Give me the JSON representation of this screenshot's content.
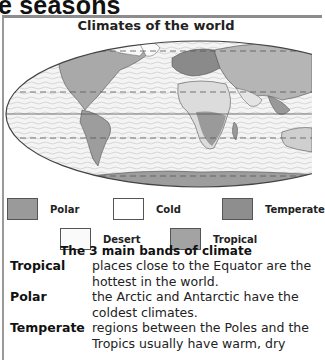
{
  "page": {
    "heading_fragment": "e seasons"
  },
  "map": {
    "title": "Climates of the world",
    "lines": [
      {
        "name": "arctic-circle",
        "style": "dashed"
      },
      {
        "name": "tropic-of-cancer",
        "style": "dashed"
      },
      {
        "name": "equator",
        "style": "solid"
      },
      {
        "name": "tropic-of-capricorn",
        "style": "dashed"
      },
      {
        "name": "antarctic-circle",
        "style": "dashed"
      }
    ]
  },
  "legend": {
    "items": [
      {
        "label": "Polar",
        "color": "#9a9a9a"
      },
      {
        "label": "Cold",
        "color": "#ffffff"
      },
      {
        "label": "Temperate",
        "color": "#8e8e8e"
      },
      {
        "label": "Desert",
        "color": "#fafafa"
      },
      {
        "label": "Tropical",
        "color": "#a3a3a3"
      }
    ]
  },
  "bands": {
    "title": "The 3 main bands of climate",
    "definitions": [
      {
        "term": "Tropical",
        "text": "places close to the Equator are the hottest in the world."
      },
      {
        "term": "Polar",
        "text": "the Arctic and Antarctic have the coldest climates."
      },
      {
        "term": "Temperate",
        "text": "regions between the Poles and the Tropics usually have warm, dry"
      }
    ]
  }
}
